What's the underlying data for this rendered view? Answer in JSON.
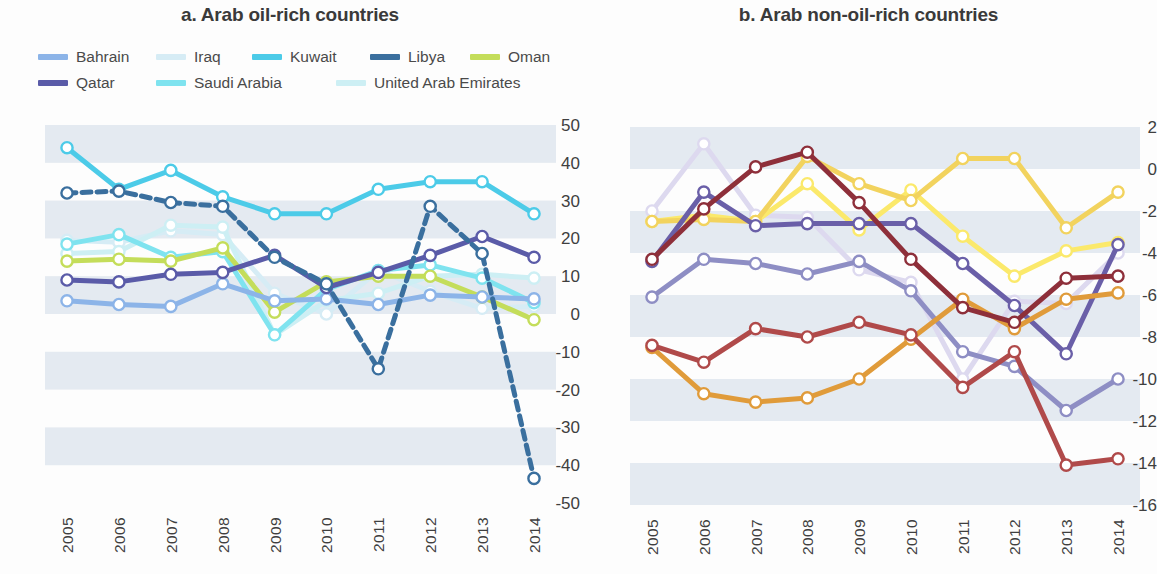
{
  "panels": {
    "a": {
      "title": "a. Arab oil-rich countries",
      "legend": [
        {
          "label": "Bahrain",
          "color": "#8cb4e8"
        },
        {
          "label": "Iraq",
          "color": "#d6ecf5"
        },
        {
          "label": "Kuwait",
          "color": "#4ccbe8"
        },
        {
          "label": "Libya",
          "color": "#3a6f9e"
        },
        {
          "label": "Oman",
          "color": "#c4dd5a"
        },
        {
          "label": "Qatar",
          "color": "#5a5ba8"
        },
        {
          "label": "Saudi Arabia",
          "color": "#7fe3ef"
        },
        {
          "label": "United Arab Emirates",
          "color": "#cdeff4"
        }
      ]
    },
    "b": {
      "title": "b. Arab non-oil-rich countries",
      "legend": [
        {
          "label": "Egypt",
          "color": "#b04a4a"
        },
        {
          "label": "Jordan",
          "color": "#8e8ec4"
        },
        {
          "label": "Lebanon",
          "color": "#e09b3a"
        },
        {
          "label": "Morocco",
          "color": "#8e2f3a"
        },
        {
          "label": "Sudan",
          "color": "#f2d35e"
        },
        {
          "label": "Syria",
          "color": "#6a5fa8"
        },
        {
          "label": "Tunisia",
          "color": "#fbe96b"
        },
        {
          "label": "Yemen",
          "color": "#ddd9ef"
        }
      ]
    }
  },
  "chart_data": [
    {
      "type": "line",
      "title": "a. Arab oil-rich countries",
      "xlabel": "",
      "ylabel": "",
      "x": [
        "2005",
        "2006",
        "2007",
        "2008",
        "2009",
        "2010",
        "2011",
        "2012",
        "2013",
        "2014"
      ],
      "ylim": [
        -50,
        50
      ],
      "yticks": [
        50,
        40,
        30,
        20,
        10,
        0,
        -10,
        -20,
        -30,
        -40,
        -50
      ],
      "grid": "horizontal-bands",
      "legend_position": "top",
      "series": [
        {
          "name": "Bahrain",
          "color": "#8cb4e8",
          "values": [
            3.5,
            2.5,
            2.0,
            8.0,
            3.5,
            4.0,
            2.5,
            5.0,
            4.5,
            4.0
          ]
        },
        {
          "name": "Iraq",
          "color": "#d6ecf5",
          "values": [
            19.5,
            19.0,
            22.0,
            21.0,
            5.5,
            0.0,
            11.5,
            6.0,
            1.5,
            2.0
          ]
        },
        {
          "name": "Kuwait",
          "color": "#4ccbe8",
          "values": [
            44.0,
            33.0,
            38.0,
            31.0,
            26.5,
            26.5,
            33.0,
            35.0,
            35.0,
            26.5
          ]
        },
        {
          "name": "Libya",
          "color": "#3a6f9e",
          "values": [
            32.0,
            32.5,
            29.5,
            28.5,
            15.0,
            8.0,
            -14.5,
            28.5,
            16.0,
            -43.5
          ]
        },
        {
          "name": "Oman",
          "color": "#c4dd5a",
          "values": [
            14.0,
            14.5,
            14.0,
            17.5,
            0.5,
            8.5,
            10.0,
            10.0,
            4.5,
            -1.5
          ]
        },
        {
          "name": "Qatar",
          "color": "#5a5ba8",
          "values": [
            9.0,
            8.5,
            10.5,
            11.0,
            15.5,
            7.0,
            11.0,
            15.5,
            20.5,
            15.0
          ]
        },
        {
          "name": "Saudi Arabia",
          "color": "#7fe3ef",
          "values": [
            18.5,
            21.0,
            15.0,
            16.5,
            -5.5,
            6.5,
            11.5,
            13.0,
            9.5,
            3.0
          ]
        },
        {
          "name": "United Arab Emirates",
          "color": "#cdeff4",
          "values": [
            16.0,
            16.5,
            23.5,
            23.0,
            -5.5,
            3.5,
            5.5,
            10.0,
            10.5,
            9.5
          ]
        }
      ]
    },
    {
      "type": "line",
      "title": "b. Arab non-oil-rich countries",
      "xlabel": "",
      "ylabel": "",
      "x": [
        "2005",
        "2006",
        "2007",
        "2008",
        "2009",
        "2010",
        "2011",
        "2012",
        "2013",
        "2014"
      ],
      "ylim": [
        -16,
        2
      ],
      "yticks": [
        2,
        0,
        -2,
        -4,
        -6,
        -8,
        -10,
        -12,
        -14,
        -16
      ],
      "grid": "horizontal-bands",
      "legend_position": "top",
      "series": [
        {
          "name": "Egypt",
          "color": "#b04a4a",
          "values": [
            -8.4,
            -9.2,
            -7.6,
            -8.0,
            -7.3,
            -7.9,
            -10.4,
            -8.7,
            -14.1,
            -13.8
          ]
        },
        {
          "name": "Jordan",
          "color": "#8e8ec4",
          "values": [
            -6.1,
            -4.3,
            -4.5,
            -5.0,
            -4.4,
            -5.8,
            -8.7,
            -9.4,
            -11.5,
            -10.0
          ]
        },
        {
          "name": "Lebanon",
          "color": "#e09b3a",
          "values": [
            -8.5,
            -10.7,
            -11.1,
            -10.9,
            -10.0,
            -8.1,
            -6.2,
            -7.6,
            -6.2,
            -5.9
          ]
        },
        {
          "name": "Morocco",
          "color": "#8e2f3a",
          "values": [
            -4.3,
            -1.9,
            0.1,
            0.8,
            -1.6,
            -4.3,
            -6.6,
            -7.3,
            -5.2,
            -5.1
          ]
        },
        {
          "name": "Sudan",
          "color": "#f2d35e",
          "values": [
            -2.5,
            -2.4,
            -2.5,
            0.6,
            -0.7,
            -1.5,
            0.5,
            0.5,
            -2.8,
            -1.1
          ]
        },
        {
          "name": "Syria",
          "color": "#6a5fa8",
          "values": [
            -4.4,
            -1.1,
            -2.7,
            -2.6,
            -2.6,
            -2.6,
            -4.5,
            -6.5,
            -8.8,
            -3.6
          ]
        },
        {
          "name": "Tunisia",
          "color": "#fbe96b",
          "values": [
            -2.5,
            -2.2,
            -2.5,
            -0.7,
            -2.9,
            -1.0,
            -3.2,
            -5.1,
            -3.9,
            -3.5
          ]
        },
        {
          "name": "Yemen",
          "color": "#ddd9ef",
          "values": [
            -2.0,
            1.2,
            -2.2,
            -2.3,
            -4.8,
            -5.4,
            -10.0,
            -6.3,
            -6.4,
            -4.0
          ]
        }
      ]
    }
  ]
}
